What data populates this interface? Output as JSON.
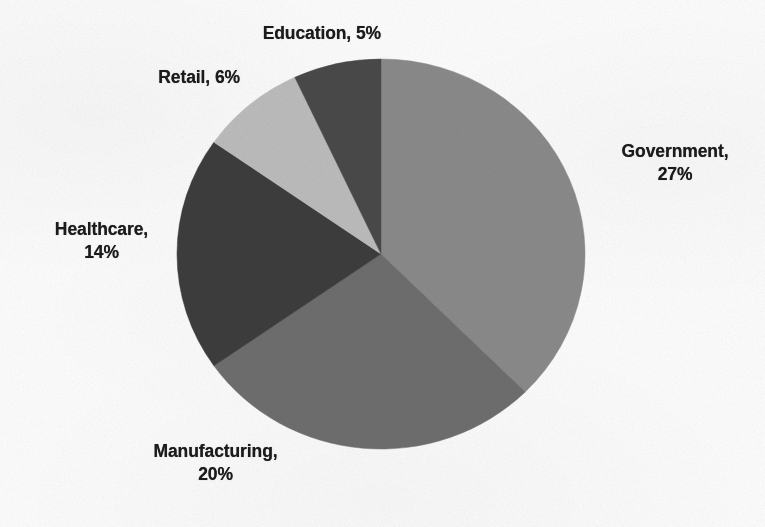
{
  "chart_data": {
    "type": "pie",
    "title": "",
    "subtitle": "",
    "xlabel": "",
    "ylabel": "",
    "legend_position": "none",
    "grid": false,
    "label_format": "{category}, {value}%",
    "start_angle_deg": 0,
    "direction": "clockwise",
    "categories": [
      "Government",
      "Manufacturing",
      "Healthcare",
      "Retail",
      "Education"
    ],
    "values": [
      27,
      20,
      14,
      6,
      5
    ],
    "units": "%",
    "total": 72,
    "slices": [
      {
        "label": "Government",
        "value": 27,
        "color": "#8a8a8a",
        "label_text": "Government,\n27%"
      },
      {
        "label": "Manufacturing",
        "value": 20,
        "color": "#6e6e6e",
        "label_text": "Manufacturing,\n20%"
      },
      {
        "label": "Healthcare",
        "value": 14,
        "color": "#3c3c3c",
        "label_text": "Healthcare,\n14%"
      },
      {
        "label": "Retail",
        "value": 6,
        "color": "#bcbcbc",
        "label_text": "Retail, 6%"
      },
      {
        "label": "Education",
        "value": 5,
        "color": "#494949",
        "label_text": "Education, 5%"
      }
    ]
  },
  "labels": {
    "government": "Government,\n27%",
    "manufacturing": "Manufacturing,\n20%",
    "healthcare": "Healthcare,\n14%",
    "retail": "Retail, 6%",
    "education": "Education, 5%"
  },
  "geometry": {
    "center_x": 381,
    "center_y": 254,
    "radius_x": 204,
    "radius_y": 195
  },
  "colors": {
    "background": "#fdfdfd",
    "text": "#1b1b1b",
    "government": "#8a8a8a",
    "manufacturing": "#6e6e6e",
    "healthcare": "#3c3c3c",
    "retail": "#bcbcbc",
    "education": "#494949"
  }
}
